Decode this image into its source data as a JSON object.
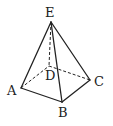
{
  "figure": {
    "type": "pyramid",
    "stroke_color": "#222222",
    "vertices": {
      "E": {
        "label": "E",
        "x": 51,
        "y": 22,
        "label_x": 45,
        "label_y": 17
      },
      "A": {
        "label": "A",
        "x": 21,
        "y": 88,
        "label_x": 7,
        "label_y": 95
      },
      "B": {
        "label": "B",
        "x": 62,
        "y": 102,
        "label_x": 58,
        "label_y": 117
      },
      "C": {
        "label": "C",
        "x": 90,
        "y": 80,
        "label_x": 94,
        "label_y": 86
      },
      "D": {
        "label": "D",
        "x": 49,
        "y": 66,
        "label_x": 45,
        "label_y": 80
      }
    },
    "solid_edges": [
      [
        "E",
        "A"
      ],
      [
        "E",
        "B"
      ],
      [
        "E",
        "C"
      ],
      [
        "A",
        "B"
      ],
      [
        "B",
        "C"
      ]
    ],
    "dashed_edges": [
      [
        "E",
        "D"
      ],
      [
        "A",
        "D"
      ],
      [
        "D",
        "C"
      ]
    ]
  }
}
